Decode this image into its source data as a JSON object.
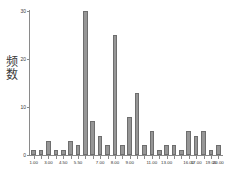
{
  "chart_data": {
    "type": "bar",
    "title": "",
    "xlabel": "",
    "ylabel": "频数",
    "ylim": [
      0,
      30
    ],
    "yticks": [
      0,
      10,
      20,
      30
    ],
    "ytick_labels": [
      "0",
      "10",
      "20",
      "30"
    ],
    "grid": false,
    "legend": null,
    "bar_color": "#969696",
    "bar_edge_color": "#6e6e6e",
    "axis_color": "#8a8a8a",
    "background": "#ffffff",
    "categories": [
      "1.00",
      "2.00",
      "3.00",
      "4.00",
      "4.50",
      "5.00",
      "5.50",
      "6.00",
      "6.50",
      "7.00",
      "7.50",
      "8.00",
      "8.50",
      "9.00",
      "9.50",
      "10.00",
      "11.00",
      "12.00",
      "13.00",
      "14.00",
      "15.00",
      "16.00",
      "17.00",
      "18.00",
      "19.00",
      "20.00"
    ],
    "values": [
      1,
      1,
      3,
      1,
      1,
      3,
      2,
      30,
      7,
      4,
      2,
      25,
      2,
      8,
      13,
      2,
      5,
      1,
      2,
      2,
      1,
      5,
      4,
      5,
      1,
      2
    ],
    "xtick_labels": [
      "1.00",
      "3.00",
      "4.50",
      "5.50",
      "7.00",
      "8.00",
      "9.00",
      "11.00",
      "13.00",
      "16.00",
      "17.00",
      "19.00",
      "20.00"
    ],
    "xtick_indices": [
      0,
      2,
      4,
      6,
      9,
      11,
      13,
      16,
      18,
      21,
      22,
      24,
      25
    ]
  }
}
